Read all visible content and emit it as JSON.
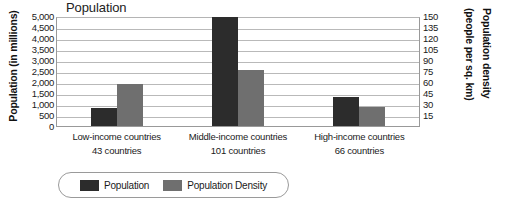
{
  "chart_data": {
    "type": "bar",
    "title": "Population",
    "categories": [
      "Low-income countries",
      "Middle-income countries",
      "High-income countries"
    ],
    "category_sublabels": [
      "43 countries",
      "101 countries",
      "66 countries"
    ],
    "series": [
      {
        "name": "Population",
        "axis": "left",
        "unit": "millions",
        "color": "#2c2c2c",
        "values": [
          800,
          4950,
          1300
        ]
      },
      {
        "name": "Population Density",
        "axis": "right",
        "unit": "people per sq. km",
        "color": "#6f6f6f",
        "values": [
          57,
          77,
          26
        ]
      }
    ],
    "ylabel": "Population (in millions)",
    "ylabel_right_line1": "Population density",
    "ylabel_right_line2": "(people per sq. km)",
    "xlabel": "",
    "ylim": [
      0,
      5000
    ],
    "ylim_right": [
      0,
      150
    ],
    "yticks": [
      "5,000",
      "4,500",
      "4,000",
      "3,500",
      "3,000",
      "2,500",
      "2,000",
      "1,500",
      "1,000",
      "500",
      "0"
    ],
    "yticks_right": [
      "150",
      "135",
      "120",
      "105",
      "90",
      "75",
      "60",
      "45",
      "30",
      "15",
      ""
    ],
    "grid": true,
    "legend_position": "bottom"
  },
  "legend": {
    "items": [
      {
        "label": "Population",
        "color": "#2c2c2c"
      },
      {
        "label": "Population Density",
        "color": "#6f6f6f"
      }
    ]
  }
}
